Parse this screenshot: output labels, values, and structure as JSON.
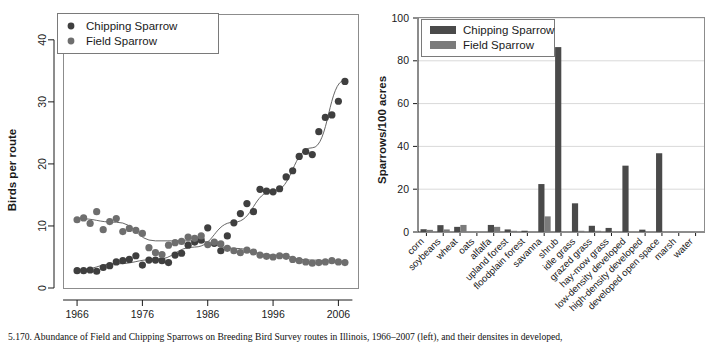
{
  "figure": {
    "caption": "5.170.  Abundance of Field and Chipping Sparrows on Breeding Bird Survey routes in Illinois, 1966–2007 (left), and their densites in developed,"
  },
  "colors": {
    "chipping": "#4a4a4a",
    "field": "#7b7b7b",
    "trend": "#555555",
    "grid": "#d9d9d9",
    "axis": "#1a1a1a",
    "background": "#ffffff"
  },
  "chart_data": [
    {
      "type": "scatter",
      "id": "left-scatter",
      "title": "",
      "xlabel": "",
      "ylabel": "Birds per route",
      "xlim": [
        1964,
        2009
      ],
      "ylim": [
        0,
        44
      ],
      "xticks": [
        1966,
        1976,
        1986,
        1996,
        2006
      ],
      "yticks": [
        0,
        10,
        20,
        30,
        40
      ],
      "grid": false,
      "legend_position": "top-left",
      "series": [
        {
          "name": "Chipping Sparrow",
          "color": "#4a4a4a",
          "x": [
            1966,
            1967,
            1968,
            1969,
            1970,
            1971,
            1972,
            1973,
            1974,
            1975,
            1976,
            1977,
            1978,
            1979,
            1980,
            1981,
            1982,
            1983,
            1984,
            1985,
            1986,
            1987,
            1988,
            1989,
            1990,
            1991,
            1992,
            1993,
            1994,
            1995,
            1996,
            1997,
            1998,
            1999,
            2000,
            2001,
            2002,
            2003,
            2004,
            2005,
            2006,
            2007
          ],
          "values": [
            2.8,
            2.8,
            2.9,
            2.7,
            3.3,
            3.6,
            4.2,
            4.4,
            4.6,
            5.2,
            3.7,
            4.5,
            4.5,
            4.4,
            4.1,
            5.3,
            5.6,
            6.9,
            7.4,
            7.7,
            9.7,
            7.2,
            6.0,
            8.4,
            10.5,
            12.0,
            13.6,
            12.3,
            15.9,
            15.6,
            15.5,
            16.0,
            17.9,
            18.9,
            21.2,
            22.0,
            21.5,
            25.2,
            27.5,
            27.9,
            30.1,
            33.3
          ]
        },
        {
          "name": "Field Sparrow",
          "color": "#7b7b7b",
          "x": [
            1966,
            1967,
            1968,
            1969,
            1970,
            1971,
            1972,
            1973,
            1974,
            1975,
            1976,
            1977,
            1978,
            1979,
            1980,
            1981,
            1982,
            1983,
            1984,
            1985,
            1986,
            1987,
            1988,
            1989,
            1990,
            1991,
            1992,
            1993,
            1994,
            1995,
            1996,
            1997,
            1998,
            1999,
            2000,
            2001,
            2002,
            2003,
            2004,
            2005,
            2006,
            2007
          ],
          "values": [
            11.0,
            11.3,
            10.4,
            12.3,
            9.4,
            10.7,
            11.2,
            9.1,
            9.6,
            9.3,
            8.8,
            6.5,
            5.7,
            5.4,
            6.9,
            7.3,
            7.5,
            8.2,
            8.0,
            8.4,
            7.0,
            7.4,
            7.1,
            6.4,
            6.0,
            5.7,
            6.1,
            5.8,
            5.3,
            5.1,
            5.0,
            5.2,
            5.1,
            4.6,
            4.4,
            4.2,
            4.0,
            4.1,
            4.2,
            4.4,
            4.2,
            4.1
          ]
        }
      ],
      "trend_lines": [
        {
          "series": "Chipping Sparrow",
          "x": [
            1966,
            1972,
            1978,
            1984,
            1990,
            1996,
            2002,
            2007
          ],
          "values": [
            2.9,
            3.9,
            4.6,
            6.6,
            10.6,
            15.6,
            22.6,
            33.5
          ]
        },
        {
          "series": "Field Sparrow",
          "x": [
            1966,
            1972,
            1978,
            1984,
            1990,
            1996,
            2002,
            2007
          ],
          "values": [
            11.2,
            10.6,
            7.6,
            7.6,
            6.4,
            5.3,
            4.5,
            4.2
          ]
        }
      ]
    },
    {
      "type": "bar",
      "id": "right-bars",
      "title": "",
      "xlabel": "",
      "ylabel": "Sparrows/100 acres",
      "ylim": [
        0,
        100
      ],
      "yticks": [
        0,
        20,
        40,
        60,
        80,
        100
      ],
      "grid": true,
      "legend_position": "top-left",
      "categories": [
        "corn",
        "soybeans",
        "wheat",
        "oats",
        "alfalfa",
        "upland forest",
        "floodplain forest",
        "savanna",
        "shrub",
        "idle grass",
        "grazed grass",
        "hay-mow grass",
        "low-density developed",
        "high-density developed",
        "developed open space",
        "marsh",
        "water"
      ],
      "series": [
        {
          "name": "Chipping Sparrow",
          "color": "#4a4a4a",
          "values": [
            1.3,
            3.2,
            2.4,
            0.0,
            3.3,
            1.2,
            0.6,
            22.4,
            86.4,
            13.4,
            2.9,
            1.9,
            31.0,
            1.1,
            36.8,
            0.0,
            0.0
          ]
        },
        {
          "name": "Field Sparrow",
          "color": "#7b7b7b",
          "values": [
            1.0,
            1.2,
            3.3,
            0.0,
            2.4,
            0.5,
            0.0,
            7.3,
            0.0,
            0.4,
            0.3,
            0.0,
            0.0,
            0.0,
            0.0,
            0.0,
            0.0
          ]
        }
      ]
    }
  ],
  "legends": {
    "chipping_label": "Chipping Sparrow",
    "field_label": "Field Sparrow"
  },
  "axis_titles": {
    "left_y": "Birds per route",
    "right_y": "Sparrows/100 acres"
  }
}
